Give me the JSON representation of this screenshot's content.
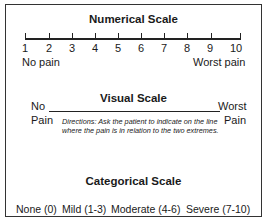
{
  "numerical_scale": {
    "title": "Numerical Scale",
    "numbers": [
      "1",
      "2",
      "3",
      "4",
      "5",
      "6",
      "7",
      "8",
      "9",
      "10"
    ],
    "left_label": "No pain",
    "right_label": "Worst pain"
  },
  "visual_scale": {
    "title": "Visual Scale",
    "left_label_line1": "No",
    "left_label_line2": "Pain",
    "right_label_line1": "Worst",
    "right_label_line2": "Pain",
    "directions": "Directions: Ask the patient to indicate on the line where the pain is in relation to the two extremes."
  },
  "categorical_scale": {
    "title": "Categorical Scale",
    "categories": [
      "None (0)",
      "Mild (1-3)",
      "Moderate (4-6)",
      "Severe (7-10)"
    ]
  }
}
